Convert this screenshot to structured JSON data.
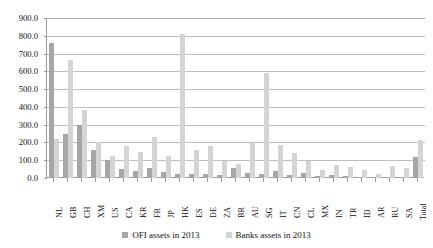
{
  "chart_data": {
    "type": "bar",
    "title": "",
    "subtitle": "",
    "xlabel": "",
    "ylabel": "",
    "ylim": [
      0.0,
      900.0
    ],
    "ytick_step": 100.0,
    "yticks": [
      "0.0",
      "100.0",
      "200.0",
      "300.0",
      "400.0",
      "500.0",
      "600.0",
      "700.0",
      "800.0",
      "900.0"
    ],
    "grid": true,
    "legend_position": "bottom",
    "categories": [
      "NL",
      "GB",
      "CH",
      "XM",
      "US",
      "CA",
      "KR",
      "FR",
      "JP",
      "HK",
      "ES",
      "DE",
      "ZA",
      "BR",
      "AU",
      "SG",
      "IT",
      "CN",
      "CL",
      "MX",
      "IN",
      "TR",
      "ID",
      "AR",
      "RU",
      "SA",
      "Total"
    ],
    "series": [
      {
        "name": "OFI assets in 2013",
        "color": "#a6a6a6",
        "values": [
          760.0,
          250.0,
          300.0,
          160.0,
          100.0,
          50.0,
          40.0,
          55.0,
          35.0,
          25.0,
          20.0,
          22.0,
          18.0,
          58.0,
          30.0,
          20.0,
          42.0,
          15.0,
          28.0,
          12.0,
          18.0,
          10.0,
          8.0,
          6.0,
          7.0,
          5.0,
          120.0
        ]
      },
      {
        "name": "Banks assets in 2013",
        "color": "#d4d4d4",
        "values": [
          220.0,
          665.0,
          380.0,
          205.0,
          125.0,
          180.0,
          145.0,
          230.0,
          125.0,
          810.0,
          155.0,
          180.0,
          95.0,
          80.0,
          195.0,
          590.0,
          185.0,
          140.0,
          95.0,
          45.0,
          75.0,
          60.0,
          45.0,
          25.0,
          65.0,
          55.0,
          215.0
        ]
      }
    ]
  },
  "legend": {
    "items": [
      {
        "label": "OFI assets in 2013",
        "color": "#a6a6a6"
      },
      {
        "label": "Banks assets in 2013",
        "color": "#d4d4d4"
      }
    ]
  }
}
